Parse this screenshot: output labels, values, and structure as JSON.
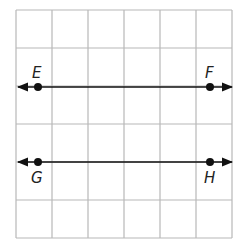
{
  "diagram": {
    "grid": {
      "columns": 6,
      "rows": 6,
      "line_color": "#b8b8b8"
    },
    "lines": [
      {
        "name": "line-EF",
        "points": [
          {
            "label": "E",
            "grid_x": 0.6,
            "grid_y": 2
          },
          {
            "label": "F",
            "grid_x": 5.4,
            "grid_y": 2
          }
        ],
        "label_position": "above"
      },
      {
        "name": "line-GH",
        "points": [
          {
            "label": "G",
            "grid_x": 0.6,
            "grid_y": 4
          },
          {
            "label": "H",
            "grid_x": 5.4,
            "grid_y": 4
          }
        ],
        "label_position": "below"
      }
    ],
    "line_color": "#111111"
  }
}
